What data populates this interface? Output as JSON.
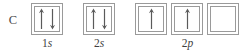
{
  "diagram": {
    "type": "orbital-box-diagram",
    "element_symbol": "C",
    "element_name": "carbon",
    "colors": {
      "background": "#ffffff",
      "box_border": "#9a9a9a",
      "arrow": "#5a5a5a",
      "text": "#3f3f3f"
    },
    "subshells": [
      {
        "id": "1s",
        "principal_number": "1",
        "orbital_letter": "s",
        "boxes": [
          {
            "electrons": [
              "up",
              "down"
            ]
          }
        ]
      },
      {
        "id": "2s",
        "principal_number": "2",
        "orbital_letter": "s",
        "boxes": [
          {
            "electrons": [
              "up",
              "down"
            ]
          }
        ]
      },
      {
        "id": "2p",
        "principal_number": "2",
        "orbital_letter": "p",
        "boxes": [
          {
            "electrons": [
              "up"
            ]
          },
          {
            "electrons": [
              "up"
            ]
          },
          {
            "electrons": []
          }
        ]
      }
    ]
  }
}
